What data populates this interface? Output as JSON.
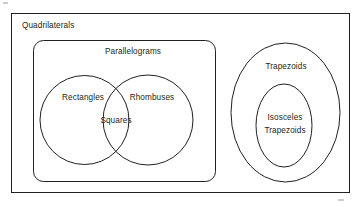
{
  "diagram": {
    "width": 360,
    "height": 207,
    "background_color": "#ffffff",
    "stroke_color": "#231f20"
  },
  "labels": {
    "quadrilaterals": "Quadrilaterals",
    "parallelograms": "Parallelograms",
    "rectangles": "Rectangles",
    "rhombuses": "Rhombuses",
    "squares": "Squares",
    "trapezoids": "Trapezoids",
    "isosceles_trapezoids_line1": "Isosceles",
    "isosceles_trapezoids_line2": "Trapezoids"
  },
  "sets": [
    {
      "name": "Quadrilaterals",
      "shape": "rectangle",
      "role": "universe",
      "contains": [
        "Parallelograms",
        "Trapezoids"
      ]
    },
    {
      "name": "Parallelograms",
      "shape": "rounded-rectangle",
      "role": "subset",
      "contains": [
        "Rectangles",
        "Rhombuses",
        "Squares"
      ]
    },
    {
      "name": "Rectangles",
      "shape": "circle",
      "role": "subset",
      "overlaps": [
        "Rhombuses"
      ]
    },
    {
      "name": "Rhombuses",
      "shape": "circle",
      "role": "subset",
      "overlaps": [
        "Rectangles"
      ]
    },
    {
      "name": "Squares",
      "shape": "intersection",
      "role": "intersection",
      "of": [
        "Rectangles",
        "Rhombuses"
      ]
    },
    {
      "name": "Trapezoids",
      "shape": "ellipse",
      "role": "subset",
      "contains": [
        "Isosceles Trapezoids"
      ]
    },
    {
      "name": "Isosceles Trapezoids",
      "shape": "ellipse",
      "role": "subset"
    }
  ]
}
